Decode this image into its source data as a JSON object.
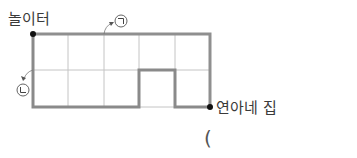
{
  "diagram": {
    "start_label": "놀이터",
    "end_label": "연아네 집",
    "route_a_marker": "㉠",
    "route_b_marker": "㉡",
    "answer_paren": "(",
    "grid": {
      "columns": 5,
      "rows": 2
    },
    "colors": {
      "route_line": "#8c8c8c",
      "grid_line": "#bdbdbd",
      "dot": "#111111"
    }
  }
}
